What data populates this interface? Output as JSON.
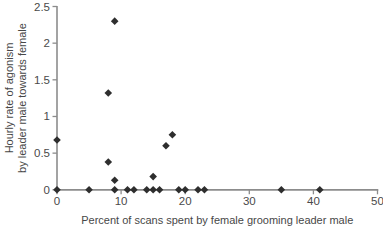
{
  "chart_data": {
    "type": "scatter",
    "title": "",
    "xlabel": "Percent of scans spent by female grooming leader male",
    "ylabel_lines": [
      "Hourly rate of agonism",
      "by leader male towards female"
    ],
    "xlim": [
      0,
      50
    ],
    "ylim": [
      0,
      2.5
    ],
    "xticks": [
      "0",
      "10",
      "20",
      "30",
      "40",
      "50"
    ],
    "yticks": [
      "0",
      "0.5",
      "1",
      "1.5",
      "2",
      "2.5"
    ],
    "grid": false,
    "legend": "none",
    "marker": "filled-diamond",
    "points": [
      [
        0,
        0
      ],
      [
        0,
        0.68
      ],
      [
        5,
        0
      ],
      [
        8,
        0.38
      ],
      [
        8,
        1.32
      ],
      [
        9,
        0
      ],
      [
        9,
        0.13
      ],
      [
        9,
        2.3
      ],
      [
        11,
        0
      ],
      [
        12,
        0
      ],
      [
        14,
        0
      ],
      [
        15,
        0
      ],
      [
        15,
        0.18
      ],
      [
        16,
        0
      ],
      [
        17,
        0.6
      ],
      [
        18,
        0.75
      ],
      [
        19,
        0
      ],
      [
        20,
        0
      ],
      [
        22,
        0
      ],
      [
        23,
        0
      ],
      [
        35,
        0
      ],
      [
        41,
        0
      ]
    ],
    "colors": {
      "marker": "#2e2e2e",
      "axis": "#8c8c8c",
      "tick_text": "#4a4a4a",
      "label_text": "#474747",
      "background": "#ffffff"
    }
  }
}
